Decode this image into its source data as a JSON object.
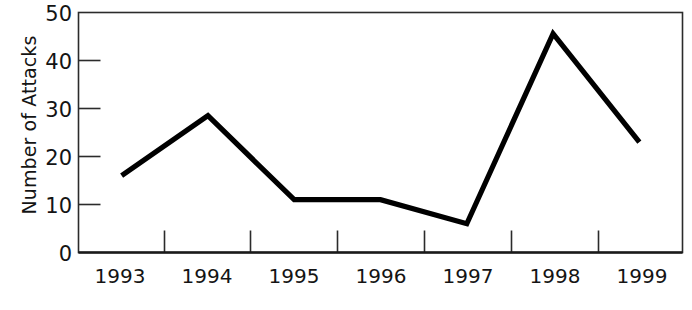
{
  "chart_data": {
    "type": "line",
    "title": "",
    "xlabel": "",
    "ylabel": "Number of Attacks",
    "categories": [
      "1993",
      "1994",
      "1995",
      "1996",
      "1997",
      "1998",
      "1999"
    ],
    "values": [
      16,
      28.5,
      11,
      11,
      6,
      45.6,
      23
    ],
    "series": [
      {
        "name": "Number of Attacks",
        "values": [
          16,
          28.5,
          11,
          11,
          6,
          45.6,
          23
        ]
      }
    ],
    "ylim": [
      0,
      50
    ],
    "y_ticks": [
      0,
      10,
      20,
      30,
      40,
      50
    ],
    "y_tick_labels": [
      "0",
      "10",
      "20",
      "30",
      "40",
      "50"
    ],
    "grid": false,
    "legend": "none",
    "line_color": "#000000",
    "axis_color": "#2b2b2b",
    "background_color": "#ffffff"
  },
  "axis": {
    "y_title": "Number of Attacks",
    "y_labels": [
      "50",
      "40",
      "30",
      "20",
      "10",
      "0"
    ],
    "x_labels": [
      "1993",
      "1994",
      "1995",
      "1996",
      "1997",
      "1998",
      "1999"
    ]
  }
}
